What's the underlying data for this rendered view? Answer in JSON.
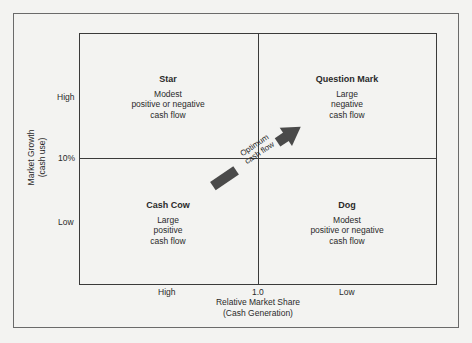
{
  "diagram": {
    "type": "BCG growth-share matrix",
    "quadrants": [
      {
        "id": "star",
        "title": "Star",
        "description": "Modest\npositive or negative\ncash flow"
      },
      {
        "id": "question-mark",
        "title": "Question Mark",
        "description": "Large\nnegative\ncash flow"
      },
      {
        "id": "cash-cow",
        "title": "Cash Cow",
        "description": "Large\npositive\ncash flow"
      },
      {
        "id": "dog",
        "title": "Dog",
        "description": "Modest\npositive or negative\ncash flow"
      }
    ],
    "y_axis": {
      "title": "Market Growth\n(cash use)",
      "ticks": {
        "high": "High",
        "mid": "10%",
        "low": "Low"
      }
    },
    "x_axis": {
      "title": "Relative Market Share\n(Cash Generation)",
      "ticks": {
        "high": "High",
        "mid": "1.0",
        "low": "Low"
      }
    },
    "arrow": {
      "label_line1": "Optimum",
      "label_line2": "cash flow",
      "color": "#4a4a4a"
    }
  }
}
